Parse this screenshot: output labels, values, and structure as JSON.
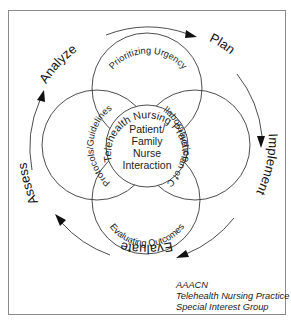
{
  "diagram": {
    "type": "cycle-venn",
    "center": {
      "ring_label": "Telehealth Nursing Practice",
      "lines": [
        "Patient/",
        "Family",
        "Nurse",
        "Interaction"
      ]
    },
    "petals": [
      {
        "position": "top",
        "label": "Prioritizing Urgency"
      },
      {
        "position": "right",
        "label": "Collaborative Plan of Care"
      },
      {
        "position": "bottom",
        "label": "Evaluating Outcomes"
      },
      {
        "position": "left",
        "label": "Protocols/Guidelines"
      }
    ],
    "phases": [
      {
        "label": "Analyze"
      },
      {
        "label": "Plan"
      },
      {
        "label": "Implement"
      },
      {
        "label": "Evaluate"
      },
      {
        "label": "Assess"
      }
    ],
    "flow_direction": "clockwise",
    "colors": {
      "stroke": "#3a3a3a",
      "text": "#222222",
      "background": "#ffffff",
      "frame": "#8a8a8a"
    }
  },
  "credit": {
    "lines": [
      "AAACN",
      "Telehealth Nursing Practice",
      "Special Interest Group"
    ]
  }
}
